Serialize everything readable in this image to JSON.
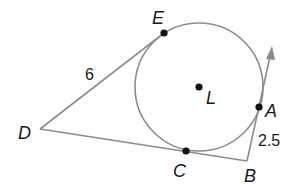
{
  "diagram": {
    "colors": {
      "line": "#8c8c8c",
      "point": "#111111",
      "text": "#1a1a1a",
      "background": "#ffffff"
    },
    "circle": {
      "center_label": "L",
      "cx": 199,
      "cy": 87,
      "r": 64
    },
    "points": [
      {
        "id": "E",
        "label": "E",
        "x": 164,
        "y": 33,
        "role": "tangent point"
      },
      {
        "id": "A",
        "label": "A",
        "x": 259,
        "y": 107,
        "role": "tangent point"
      },
      {
        "id": "C",
        "label": "C",
        "x": 186,
        "y": 151,
        "role": "tangent point"
      },
      {
        "id": "L",
        "label": "L",
        "x": 199,
        "y": 87,
        "role": "center"
      },
      {
        "id": "D",
        "label": "D",
        "x": 40,
        "y": 129,
        "role": "external vertex"
      },
      {
        "id": "B",
        "label": "B",
        "x": 247,
        "y": 161,
        "role": "external vertex"
      }
    ],
    "segments": [
      {
        "from": "D",
        "to": "E",
        "length_label": "6"
      },
      {
        "from": "D",
        "to": "B",
        "length_label": ""
      },
      {
        "from": "B",
        "to": "A",
        "length_label": "2.5",
        "extends_as_ray": true
      }
    ],
    "labels": {
      "E": "E",
      "L": "L",
      "A": "A",
      "D": "D",
      "C": "C",
      "B": "B",
      "de_length": "6",
      "ba_length": "2.5"
    }
  }
}
